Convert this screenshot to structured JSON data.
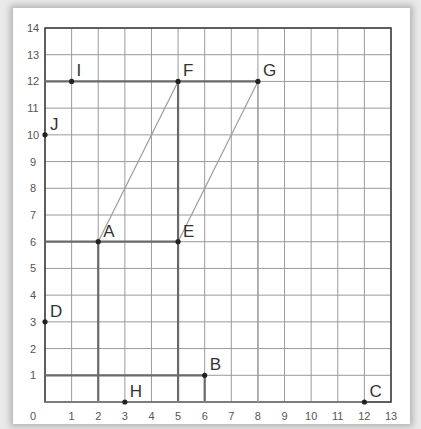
{
  "chart_data": {
    "type": "scatter",
    "title": "",
    "xlabel": "",
    "ylabel": "",
    "xlim": [
      0,
      13
    ],
    "ylim": [
      0,
      14
    ],
    "grid": true,
    "x_ticks": [
      "0",
      "1",
      "2",
      "3",
      "4",
      "5",
      "6",
      "7",
      "8",
      "9",
      "10",
      "11",
      "12",
      "13"
    ],
    "y_ticks": [
      "1",
      "2",
      "3",
      "4",
      "5",
      "6",
      "7",
      "8",
      "9",
      "10",
      "11",
      "12",
      "13",
      "14"
    ],
    "points": [
      {
        "label": "A",
        "x": 2,
        "y": 6
      },
      {
        "label": "B",
        "x": 6,
        "y": 1
      },
      {
        "label": "C",
        "x": 12,
        "y": 0
      },
      {
        "label": "D",
        "x": 0,
        "y": 3
      },
      {
        "label": "E",
        "x": 5,
        "y": 6
      },
      {
        "label": "F",
        "x": 5,
        "y": 12
      },
      {
        "label": "G",
        "x": 8,
        "y": 12
      },
      {
        "label": "H",
        "x": 3,
        "y": 0
      },
      {
        "label": "I",
        "x": 1,
        "y": 12
      },
      {
        "label": "J",
        "x": 0,
        "y": 10
      }
    ],
    "hand_drawn_lines": [
      {
        "from": [
          0,
          12
        ],
        "to": [
          8,
          12
        ],
        "style": "thick"
      },
      {
        "from": [
          0,
          6
        ],
        "to": [
          5,
          6
        ],
        "style": "thick"
      },
      {
        "from": [
          0,
          1
        ],
        "to": [
          6,
          1
        ],
        "style": "thick"
      },
      {
        "from": [
          2,
          0
        ],
        "to": [
          2,
          6
        ],
        "style": "thick"
      },
      {
        "from": [
          5,
          0
        ],
        "to": [
          5,
          12
        ],
        "style": "thick"
      },
      {
        "from": [
          6,
          0
        ],
        "to": [
          6,
          1
        ],
        "style": "thick"
      },
      {
        "from": [
          8,
          0
        ],
        "to": [
          8,
          12
        ],
        "style": "thin"
      },
      {
        "from": [
          5,
          6
        ],
        "to": [
          8,
          12
        ],
        "style": "thin"
      },
      {
        "from": [
          2,
          6
        ],
        "to": [
          5,
          12
        ],
        "style": "thin"
      },
      {
        "from": [
          0,
          0
        ],
        "to": [
          12,
          0
        ],
        "style": "thin"
      }
    ]
  }
}
